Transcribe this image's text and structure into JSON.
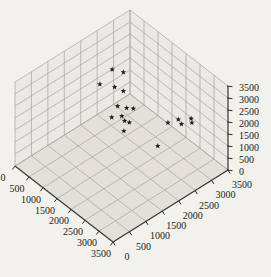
{
  "chart_data": {
    "type": "scatter",
    "subtype": "scatter3d",
    "title": "",
    "xlabel": "",
    "ylabel": "",
    "zlabel": "",
    "xlim": [
      0,
      3500
    ],
    "ylim": [
      0,
      3500
    ],
    "zlim": [
      0,
      3500
    ],
    "x_ticks": [
      0,
      500,
      1000,
      1500,
      2000,
      2500,
      3000,
      3500
    ],
    "y_ticks": [
      0,
      500,
      1000,
      1500,
      2000,
      2500,
      3000,
      3500
    ],
    "z_ticks": [
      0,
      500,
      1000,
      1500,
      2000,
      2500,
      3000,
      3500
    ],
    "grid": true,
    "legend": false,
    "view": "3d-box, z-axis ticks on right edge",
    "marker": {
      "shape": "filled-star",
      "color": "#1f1f1f",
      "size_px": 5
    },
    "series": [
      {
        "name": "points",
        "data": [
          [
            900,
            2190,
            2960
          ],
          [
            1100,
            2360,
            2880
          ],
          [
            1000,
            1730,
            2830
          ],
          [
            1200,
            2010,
            2650
          ],
          [
            1300,
            2190,
            2420
          ],
          [
            1400,
            1930,
            2110
          ],
          [
            1500,
            2120,
            1960
          ],
          [
            1550,
            2280,
            1840
          ],
          [
            1600,
            1580,
            2120
          ],
          [
            1550,
            1930,
            1830
          ],
          [
            1650,
            1930,
            1720
          ],
          [
            1700,
            2030,
            1610
          ],
          [
            1800,
            1780,
            1560
          ],
          [
            2200,
            2470,
            710
          ],
          [
            2200,
            2780,
            1410
          ],
          [
            2300,
            3010,
            1440
          ],
          [
            2400,
            3020,
            1330
          ],
          [
            2500,
            3230,
            1470
          ],
          [
            2550,
            3210,
            1360
          ]
        ]
      }
    ],
    "colors": {
      "background": "#f2f1ec",
      "wall": "#ebe9e4",
      "floor": "#e2e0d8",
      "grid": "#a6a5a0",
      "axis": "#383838",
      "tick": "#2a2a2a",
      "label": "#1c1c1c",
      "marker": "#1f1f1f"
    },
    "tick_label_font_px": 10
  }
}
